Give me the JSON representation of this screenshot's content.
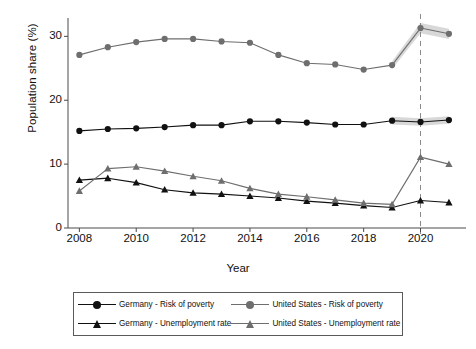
{
  "chart_data": {
    "type": "line",
    "title": "",
    "xlabel": "Year",
    "ylabel": "Population share (%)",
    "xlim": [
      2007.6,
      2021.6
    ],
    "ylim": [
      0,
      33.5
    ],
    "xticks": [
      2008,
      2010,
      2012,
      2014,
      2016,
      2018,
      2020
    ],
    "yticks": [
      0,
      10,
      20,
      30
    ],
    "grid": false,
    "legend_position": "bottom",
    "x": [
      2008,
      2009,
      2010,
      2011,
      2012,
      2013,
      2014,
      2015,
      2016,
      2017,
      2018,
      2019,
      2020,
      2021
    ],
    "series": [
      {
        "name": "Germany - Risk of poverty",
        "color": "#111111",
        "marker": "circle",
        "values": [
          15.2,
          15.5,
          15.6,
          15.8,
          16.1,
          16.1,
          16.7,
          16.7,
          16.5,
          16.2,
          16.2,
          16.8,
          16.6,
          16.9
        ],
        "band": {
          "from": 2019,
          "to": 2021,
          "lower": [
            16.2,
            16.0,
            16.3
          ],
          "upper": [
            17.4,
            17.2,
            17.5
          ]
        }
      },
      {
        "name": "Germany - Unemployment rate",
        "color": "#111111",
        "marker": "triangle",
        "values": [
          7.5,
          7.8,
          7.1,
          6.0,
          5.5,
          5.3,
          5.0,
          4.7,
          4.2,
          3.9,
          3.5,
          3.2,
          4.3,
          4.0
        ]
      },
      {
        "name": "United States - Risk of poverty",
        "color": "#6e6e6e",
        "marker": "circle",
        "values": [
          27.1,
          28.3,
          29.1,
          29.6,
          29.6,
          29.2,
          29.0,
          27.1,
          25.8,
          25.6,
          24.8,
          25.5,
          31.3,
          30.4
        ],
        "band": {
          "from": 2019,
          "to": 2021,
          "lower": [
            24.9,
            30.5,
            29.6
          ],
          "upper": [
            26.1,
            32.1,
            31.2
          ]
        }
      },
      {
        "name": "United States - Unemployment rate",
        "color": "#6e6e6e",
        "marker": "triangle",
        "values": [
          5.8,
          9.3,
          9.6,
          8.9,
          8.1,
          7.4,
          6.2,
          5.3,
          4.9,
          4.4,
          3.9,
          3.7,
          11.1,
          10.0
        ]
      }
    ],
    "annotations": [
      {
        "type": "vline",
        "x": 2020,
        "style": "dashed",
        "color": "#8a8a8a"
      }
    ],
    "band_fill_color": "#c9c9c9"
  },
  "axes": {
    "y_title": "Population share (%)",
    "x_title": "Year",
    "y_tick_labels": [
      "30",
      "20",
      "10",
      "0"
    ],
    "x_tick_labels": [
      "2008",
      "2010",
      "2012",
      "2014",
      "2016",
      "2018",
      "2020"
    ]
  },
  "legend": {
    "entries": [
      {
        "label": "Germany - Risk of poverty",
        "color": "#111111",
        "marker": "circle"
      },
      {
        "label": "United States - Risk of poverty",
        "color": "#6e6e6e",
        "marker": "circle"
      },
      {
        "label": "Germany - Unemployment rate",
        "color": "#111111",
        "marker": "triangle"
      },
      {
        "label": "United States - Unemployment rate",
        "color": "#6e6e6e",
        "marker": "triangle"
      }
    ]
  }
}
